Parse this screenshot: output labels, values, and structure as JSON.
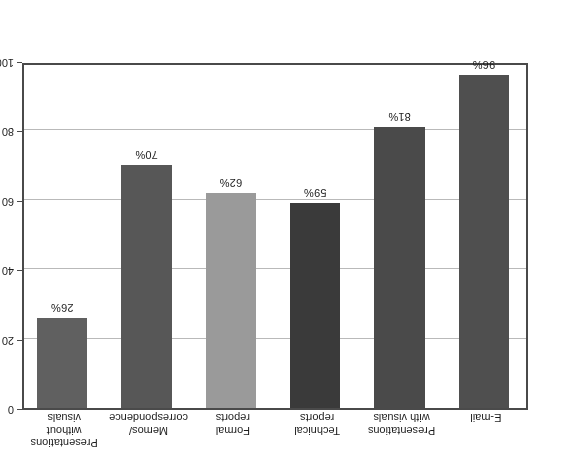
{
  "chart_data": {
    "type": "bar",
    "title": "",
    "subtitle": "",
    "xlabel": "",
    "ylabel": "",
    "orientation": "vertical",
    "rotated_180": true,
    "categories": [
      "E-mail",
      "Presentations\nwith visuals",
      "Technical\nreports",
      "Formal\nreports",
      "Memos/\ncorrespondence",
      "Presentations\nwithout\nvisuals"
    ],
    "values": [
      96,
      81,
      59,
      62,
      70,
      26
    ],
    "value_labels": [
      "96%",
      "81%",
      "59%",
      "62%",
      "70%",
      "26%"
    ],
    "ylim": [
      0,
      100
    ],
    "y_ticks": [
      0,
      20,
      40,
      60,
      80,
      100
    ],
    "y_tick_labels": [
      "0",
      "20",
      "40",
      "60",
      "80",
      "100"
    ],
    "axis_position": "right",
    "grid": true,
    "legend": false,
    "bar_colors": [
      "#4f4f4f",
      "#4a4a4a",
      "#3a3a3a",
      "#9a9a9a",
      "#575757",
      "#606060"
    ],
    "frame_color": "#4a4a4a",
    "gridline_color": "#b9b9b9",
    "background": "#ffffff",
    "text_color": "#1c1c1c"
  }
}
